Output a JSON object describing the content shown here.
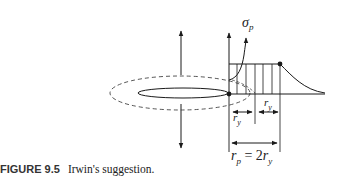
{
  "figure": {
    "label": "FIGURE 9.5",
    "caption": "Irwin's suggestion."
  },
  "diagram": {
    "stress_label": {
      "symbol": "σ",
      "sub": "p"
    },
    "ry_label_1": {
      "symbol": "r",
      "sub": "y"
    },
    "ry_label_2": {
      "symbol": "r",
      "sub": "y"
    },
    "rp_equation": {
      "lhs": "r",
      "lhs_sub": "p",
      "eq": " = 2",
      "rhs": "r",
      "rhs_sub": "y"
    },
    "colors": {
      "line": "#1a1a1a",
      "dashed": "#444444",
      "background": "#ffffff"
    }
  }
}
